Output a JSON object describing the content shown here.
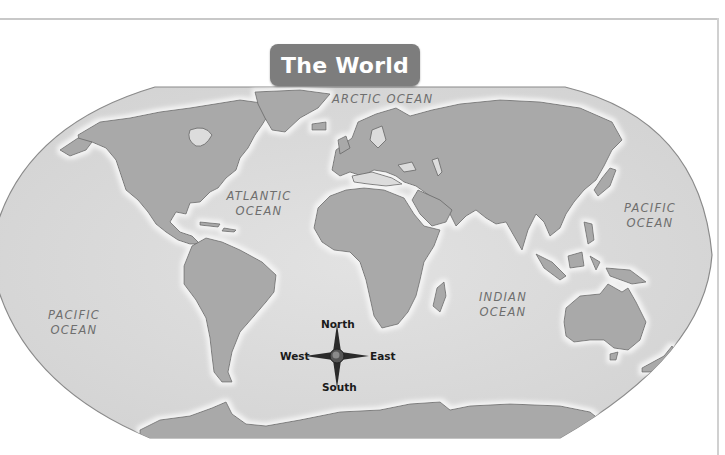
{
  "title": "The World",
  "oceans": {
    "arctic": "ARCTIC OCEAN",
    "atlantic_line1": "ATLANTIC",
    "atlantic_line2": "OCEAN",
    "pacific_east_line1": "PACIFIC",
    "pacific_east_line2": "OCEAN",
    "pacific_west_line1": "PACIFIC",
    "pacific_west_line2": "OCEAN",
    "indian_line1": "INDIAN",
    "indian_line2": "OCEAN"
  },
  "compass": {
    "north": "North",
    "south": "South",
    "east": "East",
    "west": "West"
  },
  "colors": {
    "ocean": "#dcdcdc",
    "land": "#a9a9a9",
    "coast": "#6f6f6f",
    "title_bg": "#7d7d7d",
    "title_text": "#ffffff",
    "label_text": "#6e6e6e"
  }
}
